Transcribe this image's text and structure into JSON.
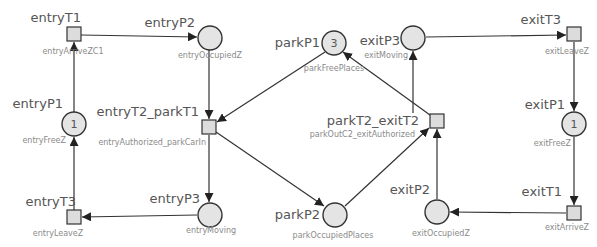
{
  "diagram": {
    "type": "petri-net",
    "colors": {
      "place_fill": "#e4e4e4",
      "transition_fill": "#dcdcdc",
      "stroke": "#333333",
      "name_text": "#555555",
      "label_text": "#8a8a8a"
    },
    "places": [
      {
        "id": "entryP1",
        "name": "entryP1",
        "label": "entryFreeZ",
        "tokens": "1"
      },
      {
        "id": "entryP2",
        "name": "entryP2",
        "label": "entryOccupiedZ",
        "tokens": ""
      },
      {
        "id": "entryP3",
        "name": "entryP3",
        "label": "entryMoving",
        "tokens": ""
      },
      {
        "id": "parkP1",
        "name": "parkP1",
        "label": "parkFreePlaces",
        "tokens": "3"
      },
      {
        "id": "parkP2",
        "name": "parkP2",
        "label": "parkOccupiedPlaces",
        "tokens": ""
      },
      {
        "id": "exitP1",
        "name": "exitP1",
        "label": "exitFreeZ",
        "tokens": "1"
      },
      {
        "id": "exitP2",
        "name": "exitP2",
        "label": "exitOccupiedZ",
        "tokens": ""
      },
      {
        "id": "exitP3",
        "name": "exitP3",
        "label": "exitMoving",
        "tokens": ""
      }
    ],
    "transitions": [
      {
        "id": "entryT1",
        "name": "entryT1",
        "label": "entryArriveZC1"
      },
      {
        "id": "entryT2_parkT1",
        "name": "entryT2_parkT1",
        "label": "entryAuthorized_parkCarIn"
      },
      {
        "id": "entryT3",
        "name": "entryT3",
        "label": "entryLeaveZ"
      },
      {
        "id": "parkT2_exitT2",
        "name": "parkT2_exitT2",
        "label": "parkOutC2_exitAuthorized"
      },
      {
        "id": "exitT1",
        "name": "exitT1",
        "label": "exitArriveZ"
      },
      {
        "id": "exitT3",
        "name": "exitT3",
        "label": "exitLeaveZ"
      }
    ],
    "arcs": [
      {
        "from": "entryP1",
        "to": "entryT1"
      },
      {
        "from": "entryT1",
        "to": "entryP2"
      },
      {
        "from": "entryP2",
        "to": "entryT2_parkT1"
      },
      {
        "from": "parkP1",
        "to": "entryT2_parkT1"
      },
      {
        "from": "entryT2_parkT1",
        "to": "entryP3"
      },
      {
        "from": "entryT2_parkT1",
        "to": "parkP2"
      },
      {
        "from": "entryP3",
        "to": "entryT3"
      },
      {
        "from": "entryT3",
        "to": "entryP1"
      },
      {
        "from": "parkP2",
        "to": "parkT2_exitT2"
      },
      {
        "from": "exitP2",
        "to": "parkT2_exitT2"
      },
      {
        "from": "parkT2_exitT2",
        "to": "parkP1"
      },
      {
        "from": "parkT2_exitT2",
        "to": "exitP3"
      },
      {
        "from": "exitP3",
        "to": "exitT3"
      },
      {
        "from": "exitT3",
        "to": "exitP1"
      },
      {
        "from": "exitP1",
        "to": "exitT1"
      },
      {
        "from": "exitT1",
        "to": "exitP2"
      }
    ]
  }
}
